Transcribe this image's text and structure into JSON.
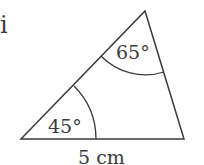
{
  "figure": {
    "part_label": "i",
    "angles": {
      "bottom_left": "45°",
      "top": "65°"
    },
    "base_length": "5 cm"
  },
  "colors": {
    "stroke": "#3a3a3a",
    "background": "#ffffff"
  }
}
